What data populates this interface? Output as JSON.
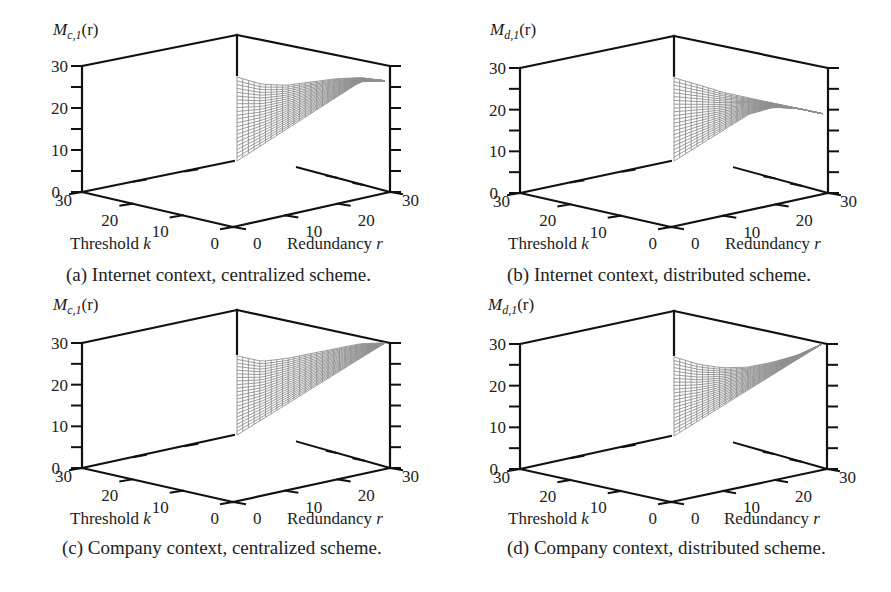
{
  "figure": {
    "panels": [
      {
        "id": "a",
        "caption": "(a) Internet context, centralized scheme.",
        "zlabel_main": "M",
        "zlabel_sub": "c,1",
        "zlabel_arg": "(r)",
        "xlabel": "Threshold k",
        "ylabel": "Redundancy r"
      },
      {
        "id": "b",
        "caption": "(b) Internet context, distributed scheme.",
        "zlabel_main": "M",
        "zlabel_sub": "d,1",
        "zlabel_arg": "(r)",
        "xlabel": "Threshold k",
        "ylabel": "Redundancy r"
      },
      {
        "id": "c",
        "caption": "(c) Company context, centralized scheme.",
        "zlabel_main": "M",
        "zlabel_sub": "c,1",
        "zlabel_arg": "(r)",
        "xlabel": "Threshold k",
        "ylabel": "Redundancy r"
      },
      {
        "id": "d",
        "caption": "(d) Company context, distributed scheme.",
        "zlabel_main": "M",
        "zlabel_sub": "d,1",
        "zlabel_arg": "(r)",
        "xlabel": "Threshold k",
        "ylabel": "Redundancy r"
      }
    ],
    "colors": {
      "axis": "#111111",
      "mesh": "#8a8a8a",
      "background": "#ffffff"
    }
  },
  "chart_data": [
    {
      "type": "surface",
      "title": "(a) Internet context, centralized scheme.",
      "zlabel": "M_{c,1}(r)",
      "xlabel": "Threshold k",
      "ylabel": "Redundancy r",
      "xlim": [
        0,
        30
      ],
      "ylim": [
        0,
        30
      ],
      "zlim": [
        0,
        30
      ],
      "z_ticks": [
        0,
        10,
        20,
        30
      ],
      "x_ticks": [
        0,
        10,
        20,
        30
      ],
      "y_ticks": [
        0,
        10,
        20,
        30
      ],
      "domain": "k <= r (triangular region)",
      "surface_profile": {
        "r": [
          0,
          5,
          10,
          15,
          20,
          25,
          30
        ],
        "max_z_along_r": [
          20,
          19.5,
          20.5,
          22.5,
          24.5,
          26,
          26.5
        ],
        "z_at_k_equals_r": [
          0,
          5,
          10,
          15,
          20,
          25,
          26.5
        ]
      }
    },
    {
      "type": "surface",
      "title": "(b) Internet context, distributed scheme.",
      "zlabel": "M_{d,1}(r)",
      "xlabel": "Threshold k",
      "ylabel": "Redundancy r",
      "xlim": [
        0,
        30
      ],
      "ylim": [
        0,
        30
      ],
      "zlim": [
        0,
        30
      ],
      "z_ticks": [
        0,
        10,
        20,
        30
      ],
      "x_ticks": [
        0,
        10,
        20,
        30
      ],
      "y_ticks": [
        0,
        10,
        20,
        30
      ],
      "domain": "k <= r (triangular region)",
      "surface_profile": {
        "r": [
          0,
          5,
          10,
          15,
          20,
          25,
          30
        ],
        "max_z_along_r": [
          20,
          19.5,
          19,
          19,
          19,
          19,
          19
        ],
        "z_at_k_equals_r": [
          0,
          5,
          10,
          15,
          18,
          19,
          19
        ]
      }
    },
    {
      "type": "surface",
      "title": "(c) Company context, centralized scheme.",
      "zlabel": "M_{c,1}(r)",
      "xlabel": "Threshold k",
      "ylabel": "Redundancy r",
      "xlim": [
        0,
        30
      ],
      "ylim": [
        0,
        30
      ],
      "zlim": [
        0,
        30
      ],
      "z_ticks": [
        0,
        10,
        20,
        30
      ],
      "x_ticks": [
        0,
        10,
        20,
        30
      ],
      "y_ticks": [
        0,
        10,
        20,
        30
      ],
      "domain": "k <= r (triangular region)",
      "surface_profile": {
        "r": [
          0,
          5,
          10,
          15,
          20,
          25,
          30
        ],
        "max_z_along_r": [
          19,
          19,
          21,
          23.5,
          26,
          28.5,
          30
        ],
        "z_at_k_equals_r": [
          0,
          5,
          10,
          15,
          20,
          25,
          30
        ]
      }
    },
    {
      "type": "surface",
      "title": "(d) Company context, distributed scheme.",
      "zlabel": "M_{d,1}(r)",
      "xlabel": "Threshold k",
      "ylabel": "Redundancy r",
      "xlim": [
        0,
        30
      ],
      "ylim": [
        0,
        30
      ],
      "zlim": [
        0,
        30
      ],
      "z_ticks": [
        0,
        10,
        20,
        30
      ],
      "x_ticks": [
        0,
        10,
        20,
        30
      ],
      "y_ticks": [
        0,
        10,
        20,
        30
      ],
      "domain": "k <= r (triangular region)",
      "surface_profile": {
        "r": [
          0,
          5,
          10,
          15,
          20,
          25,
          30
        ],
        "max_z_along_r": [
          19,
          18.5,
          19,
          20.5,
          23,
          26,
          30
        ],
        "z_at_k_equals_r": [
          0,
          5,
          10,
          15,
          20,
          25,
          30
        ]
      }
    }
  ]
}
